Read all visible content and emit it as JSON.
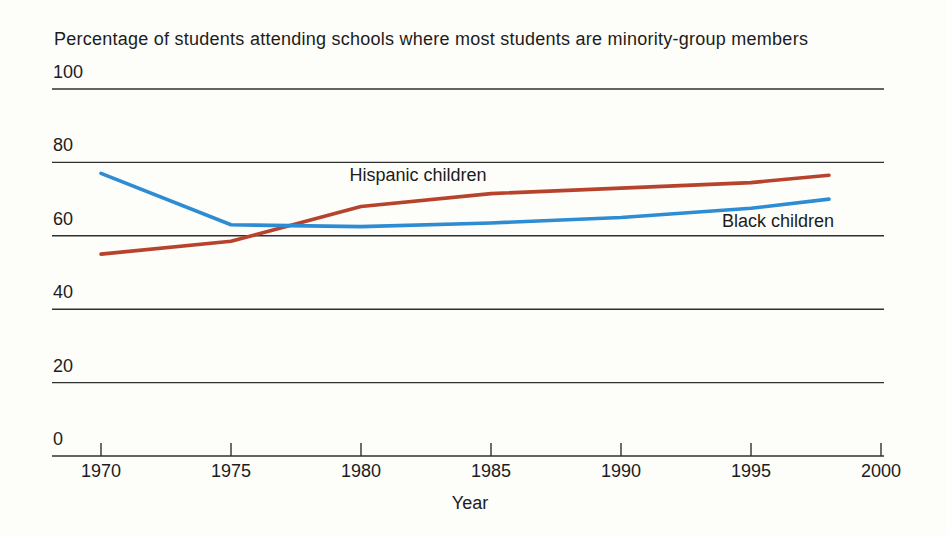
{
  "title": "Percentage of students attending schools where most students are minority-group members",
  "chart_data": {
    "type": "line",
    "title": "Percentage of students attending schools where most students are minority-group members",
    "xlabel": "Year",
    "ylabel": "",
    "xlim": [
      1970,
      2000
    ],
    "ylim": [
      0,
      100
    ],
    "xticks": [
      1970,
      1975,
      1980,
      1985,
      1990,
      1995,
      2000
    ],
    "yticks": [
      100,
      80,
      60,
      40,
      20,
      0
    ],
    "grid": "horizontal gridlines at every y tick",
    "legend_position": "inline labels next to lines",
    "x": [
      1970,
      1975,
      1980,
      1985,
      1990,
      1995,
      1998
    ],
    "series": [
      {
        "name": "Hispanic children",
        "color": "#b7432d",
        "values": [
          55,
          58.5,
          68,
          71.5,
          73,
          74.5,
          76.5
        ]
      },
      {
        "name": "Black children",
        "color": "#2d8cd2",
        "values": [
          77,
          63,
          62.5,
          63.5,
          65,
          67.5,
          70
        ]
      }
    ]
  },
  "colors": {
    "background": "#fdfdfa",
    "axis": "#303030",
    "text": "#1c1c1c",
    "hispanic_line": "#b7432d",
    "black_line": "#2d8cd2"
  }
}
